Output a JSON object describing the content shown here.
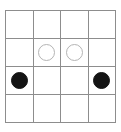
{
  "board": {
    "title": "4x4 stone grid",
    "rows": 4,
    "columns": 4,
    "grid_line_color": "#8d8d8d",
    "background_color": "#ffffff",
    "black_stone_color": "#141414",
    "white_stone_color": "#ffffff",
    "white_stone_border_color": "#b4b4b4",
    "cells": [
      [
        {
          "state": "empty",
          "label": ""
        },
        {
          "state": "empty",
          "label": ""
        },
        {
          "state": "empty",
          "label": ""
        },
        {
          "state": "empty",
          "label": ""
        }
      ],
      [
        {
          "state": "empty",
          "label": ""
        },
        {
          "state": "white",
          "label": "white stone"
        },
        {
          "state": "white",
          "label": "white stone"
        },
        {
          "state": "empty",
          "label": ""
        }
      ],
      [
        {
          "state": "black",
          "label": "black stone"
        },
        {
          "state": "empty",
          "label": ""
        },
        {
          "state": "empty",
          "label": ""
        },
        {
          "state": "black",
          "label": "black stone"
        }
      ],
      [
        {
          "state": "empty",
          "label": ""
        },
        {
          "state": "empty",
          "label": ""
        },
        {
          "state": "empty",
          "label": ""
        },
        {
          "state": "empty",
          "label": ""
        }
      ]
    ]
  }
}
